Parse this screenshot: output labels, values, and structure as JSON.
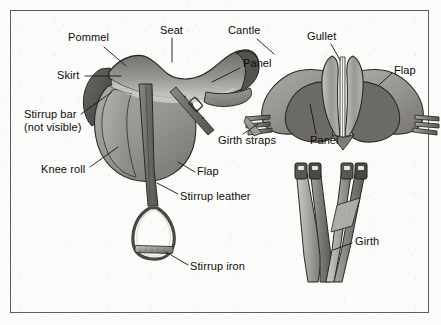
{
  "figure": {
    "title_alt": "English saddle anatomy diagram",
    "background_color": "#fbfbfa",
    "border_color": "#5d5f61",
    "label_color": "#0c0c0c",
    "leader_line_color": "#1a1a1a"
  },
  "labels": [
    {
      "id": "pommel",
      "text": "Pommel",
      "x": 68,
      "y": 37
    },
    {
      "id": "seat",
      "text": "Seat",
      "x": 160,
      "y": 30
    },
    {
      "id": "cantle",
      "text": "Cantle",
      "x": 228,
      "y": 30
    },
    {
      "id": "skirt",
      "text": "Skirt",
      "x": 57,
      "y": 73
    },
    {
      "id": "panel-side",
      "text": "Panel",
      "x": 243,
      "y": 62
    },
    {
      "id": "gullet",
      "text": "Gullet",
      "x": 307,
      "y": 35
    },
    {
      "id": "flap-rear",
      "text": "Flap",
      "x": 394,
      "y": 69
    },
    {
      "id": "stirrup-bar",
      "text": "Stirrup bar",
      "x": 24,
      "y": 114
    },
    {
      "id": "stirrup-bar-2",
      "text": "(not visible)",
      "x": 24,
      "y": 127
    },
    {
      "id": "girth-straps",
      "text": "Girth straps",
      "x": 218,
      "y": 140
    },
    {
      "id": "panel-rear",
      "text": "Panel",
      "x": 310,
      "y": 140
    },
    {
      "id": "knee-roll",
      "text": "Knee roll",
      "x": 41,
      "y": 170
    },
    {
      "id": "flap-side",
      "text": "Flap",
      "x": 197,
      "y": 171
    },
    {
      "id": "stirrup-leather",
      "text": "Stirrup leather",
      "x": 180,
      "y": 196
    },
    {
      "id": "girth",
      "text": "Girth",
      "x": 355,
      "y": 240
    },
    {
      "id": "stirrup-iron",
      "text": "Stirrup iron",
      "x": 190,
      "y": 266
    }
  ],
  "parts": {
    "side_view": "Side view of English saddle showing seat, pommel, cantle, skirt, flap, knee roll, stirrup leather and stirrup iron",
    "rear_view": "Rear view of saddle showing gullet, panels, flaps and girth straps",
    "girth_view": "Girth straps with buckles"
  }
}
